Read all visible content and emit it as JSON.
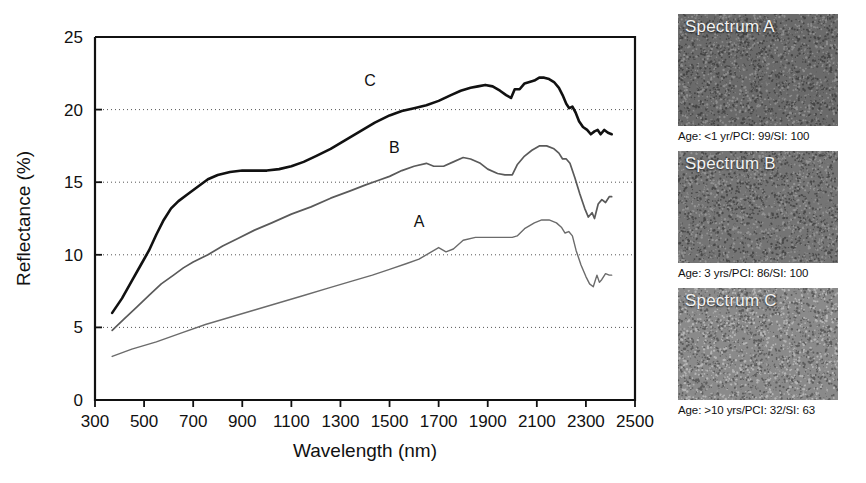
{
  "chart_data": {
    "type": "line",
    "title": "",
    "xlabel": "Wavelength (nm)",
    "ylabel": "Reflectance (%)",
    "xlim": [
      300,
      2500
    ],
    "ylim": [
      0,
      25
    ],
    "xticks": [
      300,
      500,
      700,
      900,
      1100,
      1300,
      1500,
      1700,
      1900,
      2100,
      2300,
      2500
    ],
    "yticks": [
      0,
      5,
      10,
      15,
      20,
      25
    ],
    "grid": "horizontal-dotted",
    "legend": "inline-curve-labels",
    "series": [
      {
        "name": "A",
        "label": "A",
        "color": "#6b6b6b",
        "width": 1.4,
        "label_x": 1620,
        "label_y": 11.9,
        "points": [
          [
            370,
            3.0
          ],
          [
            450,
            3.5
          ],
          [
            550,
            4.0
          ],
          [
            650,
            4.6
          ],
          [
            750,
            5.2
          ],
          [
            850,
            5.7
          ],
          [
            950,
            6.2
          ],
          [
            1050,
            6.7
          ],
          [
            1150,
            7.2
          ],
          [
            1250,
            7.7
          ],
          [
            1350,
            8.2
          ],
          [
            1430,
            8.6
          ],
          [
            1500,
            9.0
          ],
          [
            1570,
            9.4
          ],
          [
            1620,
            9.7
          ],
          [
            1660,
            10.1
          ],
          [
            1700,
            10.5
          ],
          [
            1730,
            10.2
          ],
          [
            1760,
            10.4
          ],
          [
            1800,
            11.0
          ],
          [
            1850,
            11.2
          ],
          [
            1900,
            11.2
          ],
          [
            1950,
            11.2
          ],
          [
            2000,
            11.2
          ],
          [
            2020,
            11.3
          ],
          [
            2050,
            11.8
          ],
          [
            2090,
            12.2
          ],
          [
            2120,
            12.4
          ],
          [
            2150,
            12.4
          ],
          [
            2180,
            12.2
          ],
          [
            2200,
            11.9
          ],
          [
            2215,
            11.5
          ],
          [
            2230,
            11.6
          ],
          [
            2245,
            11.3
          ],
          [
            2260,
            10.3
          ],
          [
            2280,
            9.3
          ],
          [
            2300,
            8.5
          ],
          [
            2315,
            8.0
          ],
          [
            2330,
            7.8
          ],
          [
            2345,
            8.6
          ],
          [
            2355,
            8.1
          ],
          [
            2365,
            8.3
          ],
          [
            2380,
            8.7
          ],
          [
            2395,
            8.6
          ],
          [
            2405,
            8.6
          ]
        ]
      },
      {
        "name": "B",
        "label": "B",
        "color": "#5a5a5a",
        "width": 1.7,
        "label_x": 1520,
        "label_y": 17.0,
        "points": [
          [
            370,
            4.8
          ],
          [
            420,
            5.6
          ],
          [
            470,
            6.4
          ],
          [
            520,
            7.2
          ],
          [
            570,
            8.0
          ],
          [
            620,
            8.6
          ],
          [
            660,
            9.1
          ],
          [
            700,
            9.5
          ],
          [
            760,
            10.0
          ],
          [
            820,
            10.6
          ],
          [
            880,
            11.1
          ],
          [
            950,
            11.7
          ],
          [
            1020,
            12.2
          ],
          [
            1100,
            12.8
          ],
          [
            1180,
            13.3
          ],
          [
            1260,
            13.9
          ],
          [
            1340,
            14.4
          ],
          [
            1400,
            14.8
          ],
          [
            1450,
            15.1
          ],
          [
            1500,
            15.4
          ],
          [
            1550,
            15.8
          ],
          [
            1600,
            16.1
          ],
          [
            1650,
            16.3
          ],
          [
            1680,
            16.1
          ],
          [
            1720,
            16.1
          ],
          [
            1760,
            16.4
          ],
          [
            1800,
            16.7
          ],
          [
            1830,
            16.6
          ],
          [
            1870,
            16.3
          ],
          [
            1900,
            15.9
          ],
          [
            1940,
            15.6
          ],
          [
            1970,
            15.5
          ],
          [
            2000,
            15.5
          ],
          [
            2020,
            16.2
          ],
          [
            2050,
            16.8
          ],
          [
            2080,
            17.2
          ],
          [
            2110,
            17.5
          ],
          [
            2140,
            17.5
          ],
          [
            2170,
            17.3
          ],
          [
            2190,
            17.0
          ],
          [
            2205,
            16.6
          ],
          [
            2220,
            16.6
          ],
          [
            2235,
            16.3
          ],
          [
            2255,
            15.3
          ],
          [
            2275,
            14.2
          ],
          [
            2295,
            13.2
          ],
          [
            2310,
            12.6
          ],
          [
            2325,
            12.9
          ],
          [
            2335,
            12.5
          ],
          [
            2350,
            13.5
          ],
          [
            2365,
            13.8
          ],
          [
            2380,
            13.6
          ],
          [
            2395,
            14.0
          ],
          [
            2405,
            14.0
          ]
        ]
      },
      {
        "name": "C",
        "label": "C",
        "color": "#111111",
        "width": 2.6,
        "label_x": 1420,
        "label_y": 21.6,
        "points": [
          [
            370,
            6.0
          ],
          [
            410,
            7.0
          ],
          [
            450,
            8.2
          ],
          [
            490,
            9.4
          ],
          [
            520,
            10.3
          ],
          [
            550,
            11.4
          ],
          [
            580,
            12.4
          ],
          [
            610,
            13.2
          ],
          [
            640,
            13.7
          ],
          [
            680,
            14.2
          ],
          [
            720,
            14.7
          ],
          [
            760,
            15.2
          ],
          [
            800,
            15.5
          ],
          [
            850,
            15.7
          ],
          [
            900,
            15.8
          ],
          [
            950,
            15.8
          ],
          [
            1000,
            15.8
          ],
          [
            1050,
            15.9
          ],
          [
            1100,
            16.1
          ],
          [
            1150,
            16.4
          ],
          [
            1200,
            16.8
          ],
          [
            1260,
            17.3
          ],
          [
            1320,
            17.9
          ],
          [
            1380,
            18.5
          ],
          [
            1440,
            19.1
          ],
          [
            1500,
            19.6
          ],
          [
            1550,
            19.9
          ],
          [
            1600,
            20.1
          ],
          [
            1650,
            20.3
          ],
          [
            1700,
            20.6
          ],
          [
            1750,
            21.0
          ],
          [
            1790,
            21.3
          ],
          [
            1830,
            21.5
          ],
          [
            1860,
            21.6
          ],
          [
            1890,
            21.7
          ],
          [
            1920,
            21.6
          ],
          [
            1950,
            21.3
          ],
          [
            1975,
            21.0
          ],
          [
            1995,
            20.8
          ],
          [
            2010,
            21.4
          ],
          [
            2030,
            21.4
          ],
          [
            2050,
            21.8
          ],
          [
            2070,
            21.9
          ],
          [
            2090,
            22.0
          ],
          [
            2110,
            22.2
          ],
          [
            2130,
            22.2
          ],
          [
            2150,
            22.1
          ],
          [
            2170,
            21.9
          ],
          [
            2190,
            21.5
          ],
          [
            2205,
            21.0
          ],
          [
            2220,
            20.4
          ],
          [
            2232,
            20.1
          ],
          [
            2245,
            20.2
          ],
          [
            2258,
            19.8
          ],
          [
            2272,
            19.2
          ],
          [
            2288,
            18.8
          ],
          [
            2305,
            18.6
          ],
          [
            2320,
            18.3
          ],
          [
            2335,
            18.5
          ],
          [
            2348,
            18.6
          ],
          [
            2360,
            18.3
          ],
          [
            2375,
            18.6
          ],
          [
            2390,
            18.4
          ],
          [
            2405,
            18.3
          ]
        ]
      }
    ]
  },
  "panels": [
    {
      "label": "Spectrum A",
      "caption": "Age: <1 yr/PCI: 99/SI: 100",
      "tone": "#6a6a6a",
      "seed": 11
    },
    {
      "label": "Spectrum B",
      "caption": "Age: 3 yrs/PCI: 86/SI: 100",
      "tone": "#747474",
      "seed": 29
    },
    {
      "label": "Spectrum C",
      "caption": "Age: >10 yrs/PCI: 32/SI: 63",
      "tone": "#8a8a8a",
      "seed": 47
    }
  ]
}
